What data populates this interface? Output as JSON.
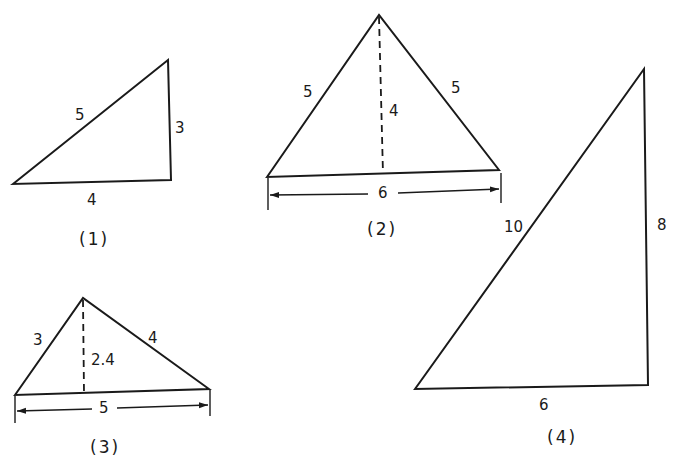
{
  "figures": [
    {
      "caption": "(1)",
      "type": "right-triangle",
      "sides": {
        "hypotenuse": "5",
        "vertical": "3",
        "base": "4"
      }
    },
    {
      "caption": "(2)",
      "type": "isosceles-triangle",
      "sides": {
        "left": "5",
        "right": "5",
        "base": "6"
      },
      "altitude": "4"
    },
    {
      "caption": "(3)",
      "type": "right-triangle-on-hypotenuse",
      "sides": {
        "left": "3",
        "right": "4",
        "base": "5"
      },
      "altitude": "2.4"
    },
    {
      "caption": "(4)",
      "type": "right-triangle",
      "sides": {
        "hypotenuse": "10",
        "vertical": "8",
        "base": "6"
      }
    }
  ]
}
